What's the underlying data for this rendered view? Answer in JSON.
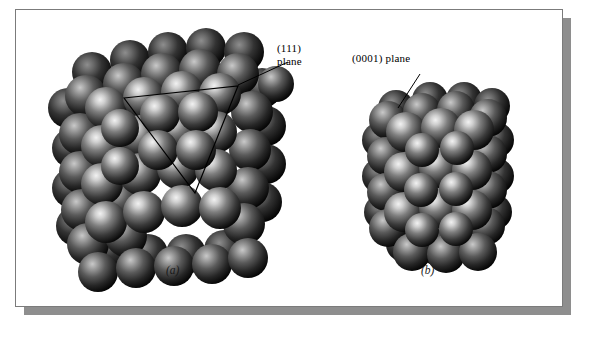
{
  "figure": {
    "background_color": "#ffffff",
    "plate_color": "#ffffff",
    "plate_border_color": "#7b7b7b",
    "shadow_color": "#8e8e8e",
    "sphere_color": "#4a4a4a",
    "sphere_highlight_color": "#e8e8e8",
    "sphere_dark_color": "#0d0d0d",
    "annotation_line_color": "#000000"
  },
  "panels": [
    {
      "id": "a",
      "caption": "(a)",
      "structure_name": "face-centered-cubic-cluster",
      "callout": {
        "line1": "(111)",
        "line2": "plane",
        "full_text": "(111) plane",
        "leader_from": [
          238,
          85
        ],
        "leader_to": [
          288,
          62
        ]
      },
      "plane_outline": {
        "shape": "triangle",
        "vertices": [
          [
            124,
            98
          ],
          [
            238,
            86
          ],
          [
            195,
            193
          ]
        ]
      }
    },
    {
      "id": "b",
      "caption": "(b)",
      "structure_name": "hexagonal-close-packed-cluster",
      "callout": {
        "line1": "(0001) plane",
        "line2": "",
        "full_text": "(0001) plane",
        "leader_from": [
          420,
          74
        ],
        "leader_to": [
          398,
          108
        ]
      },
      "plane_outline": null
    }
  ]
}
